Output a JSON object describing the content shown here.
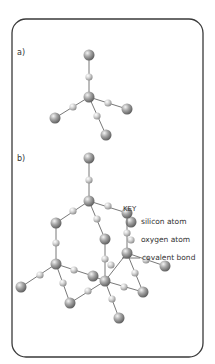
{
  "diagram": {
    "part_a_label": "a)",
    "part_b_label": "b)",
    "key": {
      "title": "KEY",
      "items": [
        {
          "label": "silicon atom",
          "icon": "silicon-atom-icon"
        },
        {
          "label": "oxygen atom",
          "icon": "oxygen-atom-icon"
        },
        {
          "label": "covalent bond",
          "icon": "covalent-bond-icon"
        }
      ]
    },
    "colors": {
      "frame": "#3a3a3a",
      "bond": "#555555",
      "atom_light": "#f2f2f2",
      "atom_dark": "#7a7a7a"
    }
  }
}
